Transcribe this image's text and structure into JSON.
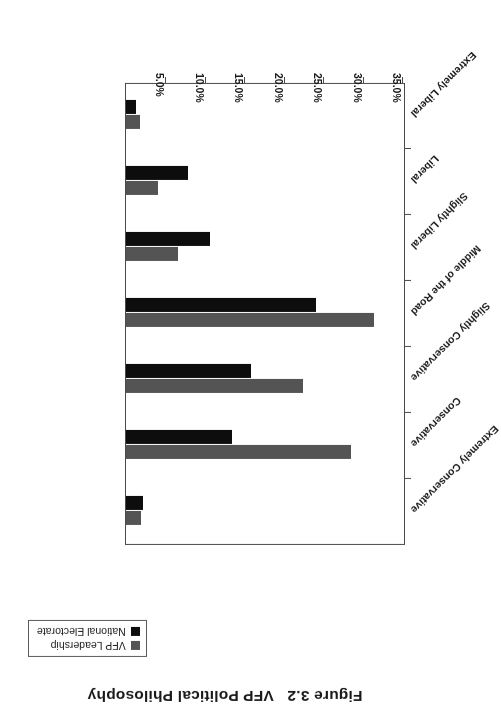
{
  "figure": {
    "title": "Figure 3.2   VFP Political Philosophy",
    "title_number": "Figure 3.2",
    "title_text": "VFP Political Philosophy",
    "rotation_degrees": 180,
    "background_color": "#ffffff"
  },
  "legend": {
    "position": "top-right",
    "border_color": "#5a5a5a",
    "entries": [
      {
        "label": "VFP Leadership",
        "color": "#545454",
        "swatch_name": "legend-swatch-vfp-leadership"
      },
      {
        "label": "National Electorate",
        "color": "#0d0d0d",
        "swatch_name": "legend-swatch-national-electorate"
      }
    ]
  },
  "axis": {
    "value_axis_labels": [
      "35.0%",
      "30.0%",
      "25.0%",
      "20.0%",
      "15.0%",
      "10.0%",
      "5.0%"
    ],
    "value_axis_values": [
      35,
      30,
      25,
      20,
      15,
      10,
      5
    ],
    "value_axis_max": 35,
    "value_axis_min": 0,
    "baseline_side": "right",
    "tick_color": "#4a4a4a"
  },
  "chart_data": {
    "type": "bar",
    "orientation": "horizontal",
    "title": "Figure 3.2   VFP Political Philosophy",
    "xlabel": "",
    "ylabel": "",
    "categories": [
      "Extremely Conservative",
      "Conservative",
      "Slightly Conservative",
      "Middle of the Road",
      "Slightly Liberal",
      "Liberal",
      "Extremely Liberal"
    ],
    "series": [
      {
        "name": "VFP Leadership",
        "color": "#545454",
        "values": [
          1.9,
          28.5,
          22.4,
          31.5,
          6.6,
          4.0,
          1.8
        ]
      },
      {
        "name": "National Electorate",
        "color": "#0d0d0d",
        "values": [
          2.1,
          13.4,
          15.9,
          24.1,
          10.6,
          7.9,
          1.3
        ]
      }
    ],
    "ylim": [
      0,
      35
    ],
    "grid": false,
    "legend_position": "top-right",
    "value_format": "percent"
  },
  "page_corner": ""
}
